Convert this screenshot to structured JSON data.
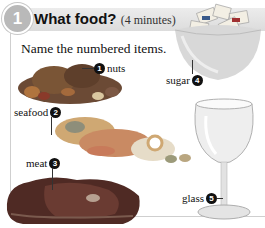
{
  "exercise": {
    "number": "1",
    "title": "What food?",
    "duration": "(4 minutes)",
    "instruction": "Name the numbered items."
  },
  "items": [
    {
      "number": "1",
      "label": "nuts"
    },
    {
      "number": "2",
      "label": "seafood"
    },
    {
      "number": "3",
      "label": "meat"
    },
    {
      "number": "4",
      "label": "sugar"
    },
    {
      "number": "5",
      "label": "glass"
    }
  ],
  "colors": {
    "header_bg": "#e2e2e2",
    "circle": "#b9b9b9",
    "badge": "#111111"
  }
}
